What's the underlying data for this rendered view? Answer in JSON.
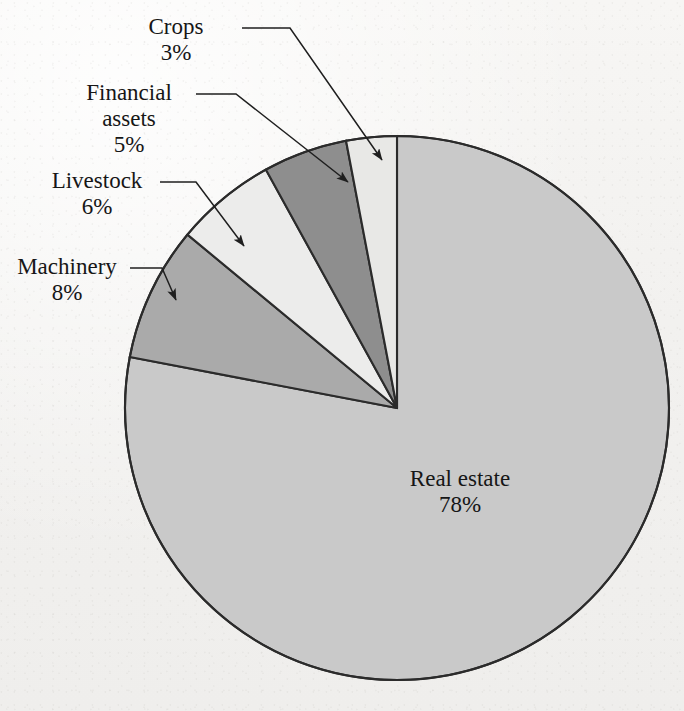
{
  "chart_data": {
    "type": "pie",
    "title": "",
    "subtitle": "",
    "xlabel": "",
    "ylabel": "",
    "legend_position": "none",
    "grid": false,
    "total": 100,
    "units": "percent",
    "start_angle_deg": 0,
    "direction": "counterclockwise-for-small-slices",
    "categories": [
      "Real estate",
      "Crops",
      "Financial assets",
      "Livestock",
      "Machinery"
    ],
    "values": [
      78,
      3,
      5,
      6,
      8
    ],
    "slices": [
      {
        "name": "Real estate",
        "label": "Real estate",
        "percent": 78,
        "percent_text": "78%",
        "color": "#c9c9c9",
        "label_placement": "inside"
      },
      {
        "name": "Crops",
        "label": "Crops",
        "percent": 3,
        "percent_text": "3%",
        "color": "#e8e8e6",
        "label_placement": "callout"
      },
      {
        "name": "Financial assets",
        "label": "Financial assets",
        "label_line1": "Financial",
        "label_line2": "assets",
        "percent": 5,
        "percent_text": "5%",
        "color": "#8e8e8e",
        "label_placement": "callout"
      },
      {
        "name": "Livestock",
        "label": "Livestock",
        "percent": 6,
        "percent_text": "6%",
        "color": "#ececeb",
        "label_placement": "callout"
      },
      {
        "name": "Machinery",
        "label": "Machinery",
        "percent": 8,
        "percent_text": "8%",
        "color": "#aaaaaa",
        "label_placement": "callout"
      }
    ]
  },
  "figure": {
    "background_color": "#f2f1ef",
    "outline_color": "#2b2b2b",
    "text_color": "#161616"
  },
  "labels": {
    "crops": {
      "name": "Crops",
      "percent": "3%"
    },
    "financial_assets": {
      "line1": "Financial",
      "line2": "assets",
      "percent": "5%"
    },
    "livestock": {
      "name": "Livestock",
      "percent": "6%"
    },
    "machinery": {
      "name": "Machinery",
      "percent": "8%"
    },
    "real_estate": {
      "name": "Real estate",
      "percent": "78%"
    }
  }
}
